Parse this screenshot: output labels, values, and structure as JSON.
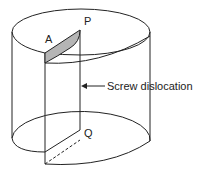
{
  "diagram": {
    "points": {
      "A": "A",
      "P": "P",
      "Q": "Q"
    },
    "annotation": "Screw dislocation",
    "colors": {
      "line": "#222222",
      "shade": "#b5b5b5"
    }
  }
}
